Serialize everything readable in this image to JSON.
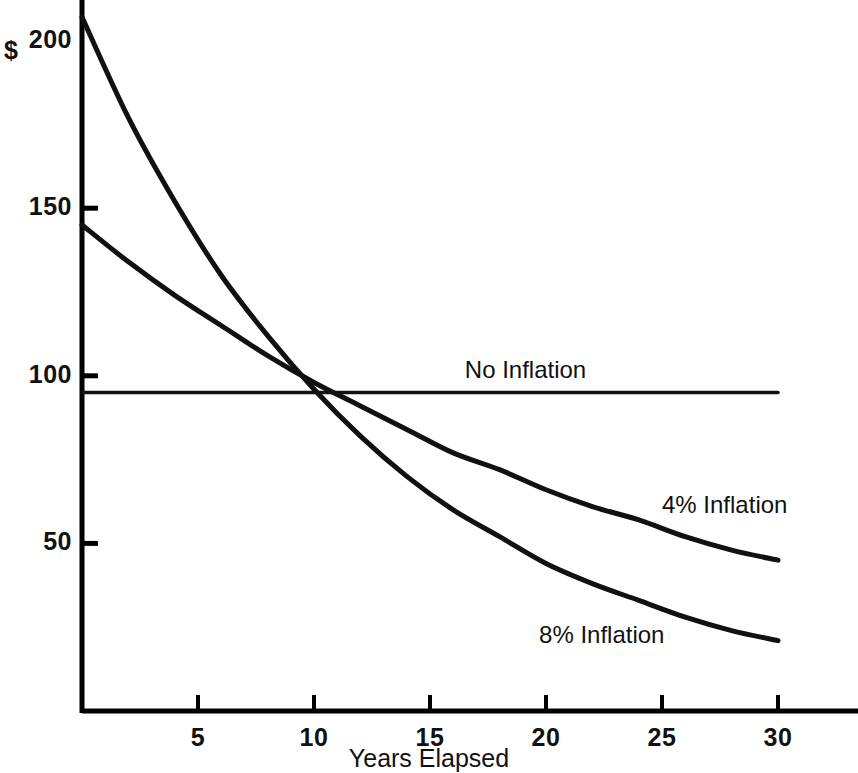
{
  "chart_data": {
    "type": "line",
    "title": "",
    "subtitle": "",
    "xlabel": "Years Elapsed",
    "ylabel": "$",
    "xlim": [
      0,
      30.5
    ],
    "ylim": [
      0,
      213
    ],
    "grid": false,
    "legend_position": "inline-right",
    "x_ticks": [
      {
        "value": 5,
        "label": "5"
      },
      {
        "value": 10,
        "label": "10"
      },
      {
        "value": 15,
        "label": "15"
      },
      {
        "value": 20,
        "label": "20"
      },
      {
        "value": 25,
        "label": "25"
      },
      {
        "value": 30,
        "label": "30"
      }
    ],
    "y_ticks": [
      {
        "value": 200,
        "label": "200",
        "tick_mark": false
      },
      {
        "value": 150,
        "label": "150",
        "tick_mark": true
      },
      {
        "value": 100,
        "label": "100",
        "tick_mark": true
      },
      {
        "value": 50,
        "label": "50",
        "tick_mark": true
      }
    ],
    "y_axis_prefix": "$",
    "x": [
      0,
      2,
      4,
      6,
      8,
      10,
      12,
      14,
      16,
      18,
      20,
      22,
      24,
      26,
      28,
      30
    ],
    "series": [
      {
        "name": "No Inflation",
        "label": "No Inflation",
        "annotation": "No Inflation",
        "shape": "flat",
        "values": [
          95,
          95,
          95,
          95,
          95,
          95,
          95,
          95,
          95,
          95,
          95,
          95,
          95,
          95,
          95,
          95
        ],
        "label_x": 16.5,
        "label_y": 101
      },
      {
        "name": "4% Inflation",
        "label": "4% Inflation",
        "annotation": "4% Inflation",
        "shape": "exponential-decay",
        "start_value": 145,
        "rate_percent": 4,
        "values": [
          145,
          134,
          124,
          115,
          106,
          98,
          91,
          84,
          77,
          72,
          66,
          61,
          57,
          52,
          48,
          45
        ],
        "label_x": 25.0,
        "label_y": 61
      },
      {
        "name": "8% Inflation",
        "label": "8% Inflation",
        "annotation": "8% Inflation",
        "shape": "exponential-decay",
        "start_value": 207,
        "rate_percent": 8,
        "values": [
          207,
          177,
          152,
          130,
          112,
          96,
          82,
          70,
          60,
          52,
          44,
          38,
          33,
          28,
          24,
          21
        ],
        "label_x": 19.7,
        "label_y": 22
      }
    ],
    "colors": {
      "axis": "#000000",
      "series_line": "#111111",
      "background": "#ffffff",
      "text": "#111111"
    },
    "notes": {
      "crossing_point_year": 9.6,
      "crossing_point_value": 101
    }
  }
}
